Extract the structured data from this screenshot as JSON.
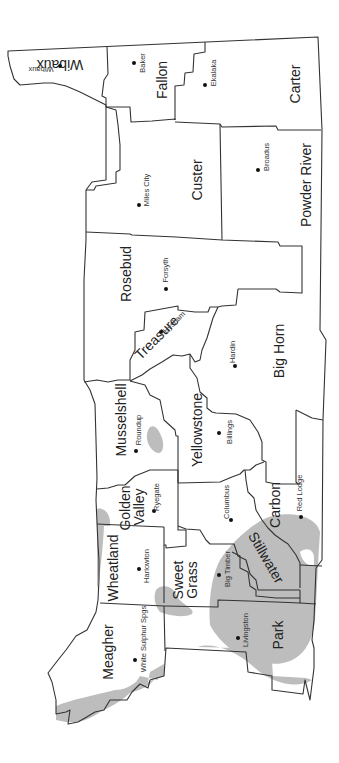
{
  "map": {
    "title": "South-central and southeastern Montana counties",
    "orientation": "rotated 90 degrees clockwise",
    "shading_color": "#bdbdbd",
    "counties": [
      {
        "name": "Wibaux",
        "seat": "Wibaux"
      },
      {
        "name": "Fallon",
        "seat": "Baker"
      },
      {
        "name": "Carter",
        "seat": "Ekalaka"
      },
      {
        "name": "Custer",
        "seat": "Miles City"
      },
      {
        "name": "Powder River",
        "seat": "Broadus"
      },
      {
        "name": "Rosebud",
        "seat": "Forsyth"
      },
      {
        "name": "Treasure",
        "seat": "Hysham"
      },
      {
        "name": "Big Horn",
        "seat": "Hardin"
      },
      {
        "name": "Musselshell",
        "seat": "Roundup"
      },
      {
        "name": "Yellowstone",
        "seat": "Billings"
      },
      {
        "name": "Golden Valley",
        "seat": "Ryegate"
      },
      {
        "name": "Carbon",
        "seat": "Red Lodge"
      },
      {
        "name": "Stillwater",
        "seat": "Columbus"
      },
      {
        "name": "Wheatland",
        "seat": "Harlowton"
      },
      {
        "name": "Sweet Grass",
        "seat": "Big Timber"
      },
      {
        "name": "Meagher",
        "seat": "White Sulphur Spgs"
      },
      {
        "name": "Park",
        "seat": "Livingston"
      }
    ],
    "labels": {
      "wibaux": "Wibaux",
      "wibaux_town": "Wibaux",
      "fallon": "Fallon",
      "baker": "Baker",
      "carter": "Carter",
      "ekalaka": "Ekalaka",
      "custer": "Custer",
      "miles_city": "Miles City",
      "powder_river": "Powder River",
      "broadus": "Broadus",
      "rosebud": "Rosebud",
      "forsyth": "Forsyth",
      "treasure": "Treasure",
      "hysham": "Hysham",
      "big_horn": "Big Horn",
      "hardin": "Hardin",
      "musselshell": "Musselshell",
      "roundup": "Roundup",
      "yellowstone": "Yellowstone",
      "billings": "Billings",
      "golden": "Golden",
      "valley": "Valley",
      "ryegate": "Ryegate",
      "carbon": "Carbon",
      "red_lodge": "Red Lodge",
      "stillwater": "Stillwater",
      "columbus": "Columbus",
      "wheatland": "Wheatland",
      "harlowton": "Harlowton",
      "sweet": "Sweet",
      "grass": "Grass",
      "big_timber": "Big Timber",
      "meagher": "Meagher",
      "white_sulphur": "White Sulphur Spgs",
      "park": "Park",
      "livingston": "Livingston"
    }
  }
}
